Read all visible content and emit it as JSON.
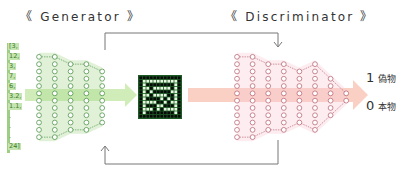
{
  "generator": {
    "title": "《 Generator 》",
    "input_vector": [
      "[3,",
      "12,",
      "3,",
      "7,",
      "6,",
      "3.2,",
      "1.1,",
      ".",
      ".",
      ".",
      "24]"
    ],
    "layers": [
      12,
      12,
      10,
      10,
      8
    ],
    "node_color": "#3e8a3a",
    "fill_color": "#a8d890"
  },
  "generated_image": {
    "rows": 12,
    "cols": 12,
    "bg": "#1c5c24",
    "pixel_on": "#e6f5de",
    "pixel_off": "#0a0a0a"
  },
  "discriminator": {
    "title": "《 Discriminator 》",
    "layers": [
      12,
      12,
      10,
      10,
      8,
      10,
      6,
      2
    ],
    "node_color": "#b25a6a",
    "fill_color": "#f8c8d4"
  },
  "outputs": [
    {
      "value": "1",
      "label": "偽物"
    },
    {
      "value": "0",
      "label": "本物"
    }
  ],
  "colors": {
    "green_arrow": "#c4e8a8",
    "pink_arrow": "#f8c8b8",
    "loop_line": "#777777"
  }
}
